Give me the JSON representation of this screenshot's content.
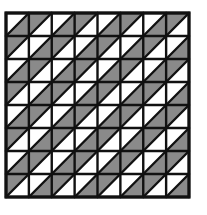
{
  "figure": {
    "type": "triangle-tiling",
    "rows": 8,
    "cols": 8,
    "diagonal": "bottom-left-to-top-right",
    "rule": "upper-left triangle shaded when (row+col) is odd; lower-right shaded when (row+col) is even",
    "colors": {
      "shade": "#8a8a8a",
      "blank": "#ffffff",
      "line": "#111111"
    },
    "cells": [
      [
        "W",
        "G",
        "W",
        "G",
        "W",
        "G",
        "W",
        "G"
      ],
      [
        "G",
        "W",
        "G",
        "W",
        "G",
        "W",
        "G",
        "W"
      ],
      [
        "W",
        "G",
        "W",
        "G",
        "W",
        "G",
        "W",
        "G"
      ],
      [
        "G",
        "W",
        "G",
        "W",
        "G",
        "W",
        "G",
        "W"
      ],
      [
        "W",
        "G",
        "W",
        "G",
        "W",
        "G",
        "W",
        "G"
      ],
      [
        "G",
        "W",
        "G",
        "W",
        "G",
        "W",
        "G",
        "W"
      ],
      [
        "W",
        "G",
        "W",
        "G",
        "W",
        "G",
        "W",
        "G"
      ],
      [
        "G",
        "W",
        "G",
        "W",
        "G",
        "W",
        "G",
        "W"
      ]
    ]
  }
}
